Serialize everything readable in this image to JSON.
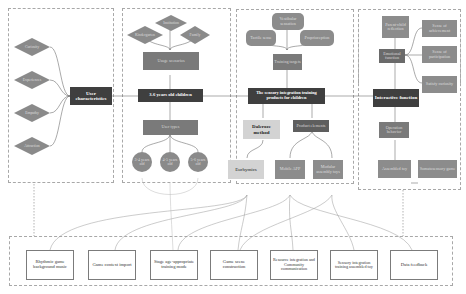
{
  "user_panel": {
    "center": "User characteristics",
    "diamonds": [
      "Curiosity",
      "Experiences",
      "Empathy",
      "Attraction"
    ]
  },
  "children_panel": {
    "center": "3-6 years old children",
    "scenarios_label": "Usage scenarios",
    "scenarios": [
      "Kindergarten",
      "Institution",
      "Family"
    ],
    "types_label": "User types",
    "ages": [
      "3-4 years old",
      "4-5 years old",
      "5-6 years old"
    ]
  },
  "product_panel": {
    "center": "The sensory integration training products for children",
    "targets_label": "Training targets",
    "targets": [
      "Tactile sense",
      "Vestibular sensation",
      "Proprioception"
    ],
    "method": "Dalcroze method",
    "elements_label": "Product elements",
    "eurhymics": "Eurhymics",
    "mobile_app": "Mobile APP",
    "modular_toys": "Modular assembly toys"
  },
  "interactive_panel": {
    "center": "Interactive function",
    "emotional": "Emotional function",
    "reflection": "Parent-child reflection",
    "senses": [
      "Sense of achievement",
      "Sense of participation",
      "Satisfy curiosity"
    ],
    "operation": "Operation behavior",
    "assembled": "Assembled toy",
    "somatosensory": "Somatosensory game"
  },
  "features": [
    "Rhythmic game background music",
    "Game context import",
    "Stage age-appropriate training mode",
    "Game scene construction",
    "Resource integration and Community communication",
    "Sensory integration training assembled toy",
    "Data feedback"
  ]
}
